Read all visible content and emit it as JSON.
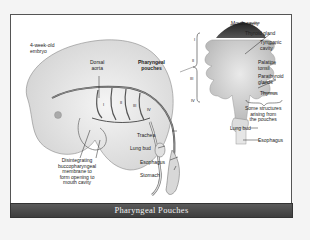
{
  "figure": {
    "caption": "Pharyngeal Pouches"
  },
  "left_labels": {
    "embryo_line1": "4-week-old",
    "embryo_line2": "embryo",
    "dorsal_line1": "Dorsal",
    "dorsal_line2": "aorta",
    "pouches_line1": "Pharyngeal",
    "pouches_line2": "pouches",
    "trachea": "Trachea",
    "lung_bud": "Lung bud",
    "esophagus": "Esophagus",
    "stomach": "Stomach",
    "membrane_line1": "Disintegrating",
    "membrane_line2": "buccopharyngeal",
    "membrane_line3": "membrane to",
    "membrane_line4": "form opening to",
    "membrane_line5": "mouth cavity",
    "roman_i": "I",
    "roman_ii": "II",
    "roman_iii": "III",
    "roman_iv": "IV"
  },
  "right_labels": {
    "mouth_cavity": "Mouth cavity",
    "thyroid_gland": "Thyroid gland",
    "tympanic_line1": "Tympanic",
    "tympanic_line2": "cavity",
    "palatine_line1": "Palatine",
    "palatine_line2": "tonsil",
    "parathyroid_line1": "Parathyroid",
    "parathyroid_line2": "glands",
    "thymus": "Thymus",
    "structures_line1": "Some structures",
    "structures_line2": "arising from",
    "structures_line3": "the pouches",
    "lung_bud": "Lung bud",
    "esophagus": "Esophagus",
    "roman_i": "I",
    "roman_ii": "II",
    "roman_iii": "III",
    "roman_iv": "IV"
  }
}
